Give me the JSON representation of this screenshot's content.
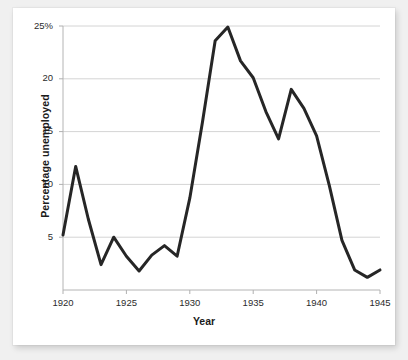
{
  "chart_data": {
    "type": "line",
    "title": "",
    "subtitle": "",
    "xlabel": "Year",
    "ylabel": "Percentage unemployed",
    "xlim": [
      1920,
      1945
    ],
    "ylim": [
      0,
      25
    ],
    "grid": "horizontal",
    "legend": "none",
    "line_color": "#262626",
    "gridline_color": "#d4d4d4",
    "axis_color": "#b0b0b0",
    "background_color": "#ffffff",
    "page_background_color": "#f0f0f0",
    "xticks": [
      1920,
      1925,
      1930,
      1935,
      1940,
      1945
    ],
    "xtick_labels": [
      "1920",
      "1925",
      "1930",
      "1935",
      "1940",
      "1945"
    ],
    "yticks": [
      5,
      10,
      15,
      20,
      25
    ],
    "ytick_labels": [
      "5",
      "10",
      "15",
      "20",
      "25%"
    ],
    "x": [
      1920,
      1921,
      1922,
      1923,
      1924,
      1925,
      1926,
      1927,
      1928,
      1929,
      1930,
      1931,
      1932,
      1933,
      1934,
      1935,
      1936,
      1937,
      1938,
      1939,
      1940,
      1941,
      1942,
      1943,
      1944,
      1945
    ],
    "series": [
      {
        "name": "Percentage unemployed",
        "values": [
          5.2,
          11.7,
          6.7,
          2.4,
          5.0,
          3.2,
          1.8,
          3.3,
          4.2,
          3.2,
          8.7,
          15.9,
          23.6,
          24.9,
          21.7,
          20.1,
          16.9,
          14.3,
          19.0,
          17.2,
          14.6,
          9.9,
          4.7,
          1.9,
          1.2,
          1.9
        ]
      }
    ],
    "annotations": []
  }
}
